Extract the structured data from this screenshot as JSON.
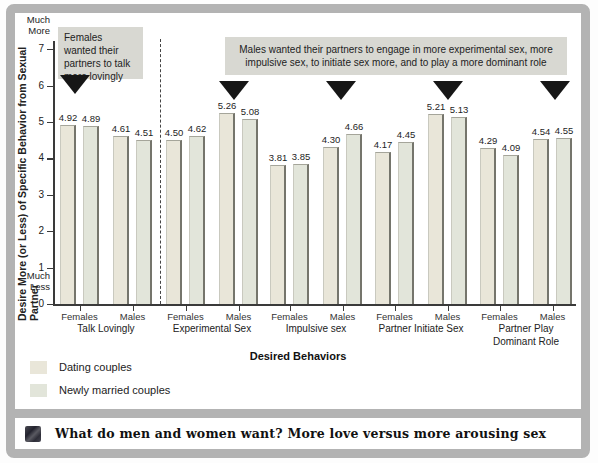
{
  "colors": {
    "frame": "#b3b3b3",
    "annotation_bg": "#d8d8d2",
    "series": [
      "#e9e6d9",
      "#e2e5da"
    ],
    "bar_edge": "#75756c",
    "triangle": "#161616",
    "axis": "#3a3a3a"
  },
  "chart_data": {
    "type": "bar",
    "title": "",
    "ylabel": "Desire More (or Less) of Specific Behavior from Sexual Partner",
    "xlabel": "Desired Behaviors",
    "ylim": [
      0,
      7
    ],
    "yticks": [
      0,
      1,
      2,
      3,
      4,
      5,
      6,
      7
    ],
    "y_top_label": "Much\nMore",
    "y_bottom_label": "Much\nLess",
    "legend_position": "bottom-left",
    "grid": false,
    "series": [
      {
        "name": "Dating couples"
      },
      {
        "name": "Newly married couples"
      }
    ],
    "groups": [
      {
        "category": "Talk Lovingly",
        "subgroups": [
          {
            "label": "Females",
            "values": [
              4.92,
              4.89
            ]
          },
          {
            "label": "Males",
            "values": [
              4.61,
              4.51
            ]
          }
        ]
      },
      {
        "category": "Experimental Sex",
        "subgroups": [
          {
            "label": "Females",
            "values": [
              4.5,
              4.62
            ]
          },
          {
            "label": "Males",
            "values": [
              5.26,
              5.08
            ]
          }
        ]
      },
      {
        "category": "Impulsive sex",
        "subgroups": [
          {
            "label": "Females",
            "values": [
              3.81,
              3.85
            ]
          },
          {
            "label": "Males",
            "values": [
              4.3,
              4.66
            ]
          }
        ]
      },
      {
        "category": "Partner Initiate Sex",
        "subgroups": [
          {
            "label": "Females",
            "values": [
              4.17,
              4.45
            ]
          },
          {
            "label": "Males",
            "values": [
              5.21,
              5.13
            ]
          }
        ]
      },
      {
        "category": "Partner Play Dominant Role",
        "category_display": "Partner Play\nDominant Role",
        "subgroups": [
          {
            "label": "Females",
            "values": [
              4.29,
              4.09
            ]
          },
          {
            "label": "Males",
            "values": [
              4.54,
              4.55
            ]
          }
        ]
      }
    ]
  },
  "annotations": {
    "left_box": "Females wanted their partners to talk more lovingly",
    "right_box": "Males wanted their partners to engage in  more experimental sex, more impulsive sex, to initiate sex more, and to play a more dominant role"
  },
  "legend": [
    {
      "label": "Dating couples"
    },
    {
      "label": "Newly married couples"
    }
  ],
  "caption": "What do men and women want? More love versus more arousing sex"
}
